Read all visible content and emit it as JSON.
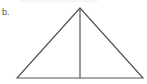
{
  "figure": {
    "label": "b.",
    "shape": "isosceles triangle with altitude",
    "stroke_color": "#555555",
    "top_rule_color": "#eeeeee"
  }
}
